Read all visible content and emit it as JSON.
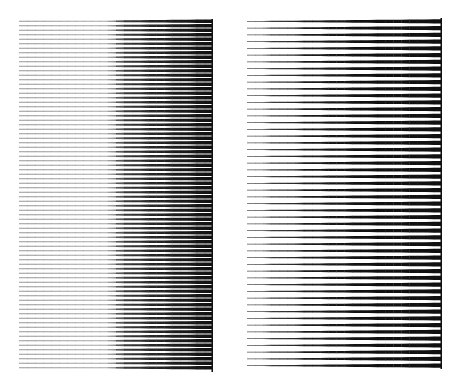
{
  "figure": {
    "width": 453,
    "height": 383,
    "background": "#ffffff",
    "ink": "#111111",
    "panels": [
      {
        "id": "left",
        "description": "dense horizontal grating; thin light lines on left that thicken abruptly into dark bars past the midpoint",
        "x": 19,
        "y": 19,
        "width": 194,
        "height": 353,
        "line_count": 78,
        "pitch": 4.5,
        "profile": [
          {
            "t": 0.0,
            "thickness": 0.9,
            "opacity": 0.45
          },
          {
            "t": 0.45,
            "thickness": 1.0,
            "opacity": 0.35
          },
          {
            "t": 0.55,
            "thickness": 1.9,
            "opacity": 0.85
          },
          {
            "t": 0.8,
            "thickness": 2.8,
            "opacity": 0.95
          },
          {
            "t": 1.0,
            "thickness": 3.6,
            "opacity": 1.0
          }
        ],
        "right_edge_rule": true
      },
      {
        "id": "right",
        "description": "sparser horizontal grating; lines taper from hairline at left to thick black bars at right edge",
        "x": 247,
        "y": 18,
        "width": 195,
        "height": 351,
        "line_count": 52,
        "pitch": 6.75,
        "profile": [
          {
            "t": 0.0,
            "thickness": 0.6,
            "opacity": 0.7
          },
          {
            "t": 0.3,
            "thickness": 1.6,
            "opacity": 0.95
          },
          {
            "t": 0.6,
            "thickness": 2.8,
            "opacity": 1.0
          },
          {
            "t": 1.0,
            "thickness": 4.2,
            "opacity": 1.0
          }
        ],
        "right_edge_rule": true
      }
    ]
  }
}
